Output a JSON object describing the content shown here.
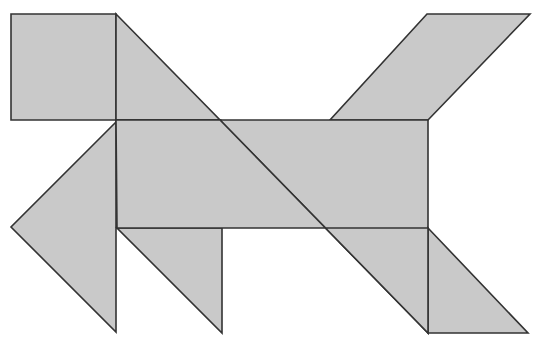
{
  "canvas": {
    "width": 540,
    "height": 346,
    "background_color": "#ffffff",
    "title": "tangram-figure"
  },
  "style": {
    "fill_color": "#c9c9c9",
    "stroke_color": "#333333",
    "stroke_width": 1.6
  },
  "figure": {
    "name": "tangram-dog-silhouette",
    "piece_count": 7
  },
  "chart_data": {
    "type": "diagram",
    "units": "pixels",
    "coordinate_origin": "top-left",
    "xlim": [
      0,
      540
    ],
    "ylim": [
      0,
      346
    ],
    "grid": false,
    "legend": false,
    "pieces": [
      {
        "id": "square-head",
        "label": "Square",
        "shape": "square",
        "points": [
          [
            11,
            14
          ],
          [
            116,
            14
          ],
          [
            116,
            120
          ],
          [
            11,
            120
          ]
        ],
        "fill": "#c9c9c9",
        "stroke": "#333333"
      },
      {
        "id": "parallelogram-tail",
        "label": "Parallelogram",
        "shape": "parallelogram",
        "points": [
          [
            427,
            14
          ],
          [
            530,
            14
          ],
          [
            428,
            120
          ],
          [
            330,
            120
          ]
        ],
        "fill": "#c9c9c9",
        "stroke": "#333333"
      },
      {
        "id": "large-triangle-neck",
        "label": "Large triangle (neck)",
        "shape": "right-triangle",
        "points": [
          [
            116,
            14
          ],
          [
            220,
            120
          ],
          [
            116,
            120
          ]
        ],
        "fill": "#c9c9c9",
        "stroke": "#333333"
      },
      {
        "id": "large-triangle-body",
        "label": "Large triangle (body)",
        "shape": "right-triangle",
        "points": [
          [
            220,
            120
          ],
          [
            428,
            120
          ],
          [
            428,
            333
          ]
        ],
        "fill": "#c9c9c9",
        "stroke": "#333333"
      },
      {
        "id": "medium-triangle-chest",
        "label": "Medium triangle (chest)",
        "shape": "right-triangle",
        "points": [
          [
            116,
            120
          ],
          [
            220,
            120
          ],
          [
            116,
            228
          ]
        ],
        "fill": "#c9c9c9",
        "stroke": "#333333"
      },
      {
        "id": "large-triangle-foreleg",
        "label": "Large triangle (foreleg)",
        "shape": "right-triangle",
        "points": [
          [
            116,
            122
          ],
          [
            11,
            227
          ],
          [
            116,
            332
          ]
        ],
        "fill": "#c9c9c9",
        "stroke": "#333333"
      },
      {
        "id": "small-triangle-hindleg",
        "label": "Small triangle (hind leg)",
        "shape": "right-triangle",
        "points": [
          [
            117,
            228
          ],
          [
            222,
            228
          ],
          [
            222,
            333
          ]
        ],
        "fill": "#c9c9c9",
        "stroke": "#333333"
      },
      {
        "id": "small-triangle-rear",
        "label": "Small triangle (rear leg)",
        "shape": "right-triangle",
        "points": [
          [
            428,
            228
          ],
          [
            528,
            333
          ],
          [
            428,
            333
          ]
        ],
        "fill": "#c9c9c9",
        "stroke": "#333333"
      },
      {
        "id": "body-fill-lower",
        "label": "Body lower region",
        "shape": "polygon",
        "points": [
          [
            116,
            120
          ],
          [
            220,
            120
          ],
          [
            428,
            333
          ],
          [
            428,
            228
          ],
          [
            222,
            228
          ],
          [
            117,
            228
          ]
        ],
        "fill": "#c9c9c9",
        "stroke": "#333333"
      }
    ]
  }
}
